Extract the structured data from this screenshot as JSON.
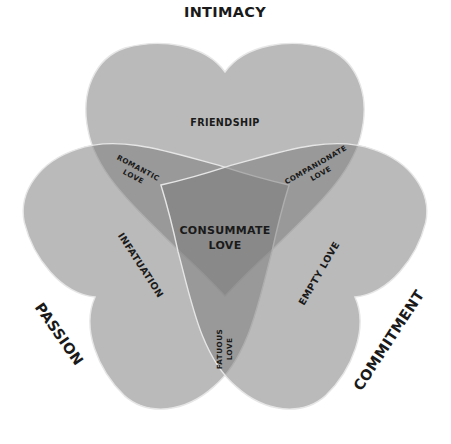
{
  "components": {
    "intimacy": "INTIMACY",
    "passion": "PASSION",
    "commitment": "COMMITMENT"
  },
  "single_regions": {
    "intimacy_only": "FRIENDSHIP",
    "passion_only": "INFATUATION",
    "commitment_only": "EMPTY LOVE"
  },
  "pair_regions": {
    "intimacy_passion": [
      "ROMANTIC",
      "LOVE"
    ],
    "intimacy_commitment": [
      "COMPANIONATE",
      "LOVE"
    ],
    "passion_commitment": [
      "FATUOUS",
      "LOVE"
    ]
  },
  "center_region": [
    "CONSUMMATE",
    "LOVE"
  ],
  "colors": {
    "heart_fill": "#7a7a7a",
    "heart_outline": "#e6e6e6",
    "text": "#1a1a1a",
    "background": "#ffffff"
  }
}
